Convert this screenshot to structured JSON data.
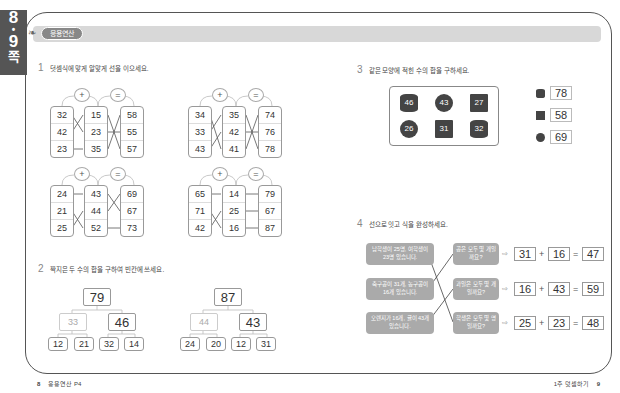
{
  "side_tab": {
    "page_top": "8",
    "dot": "•",
    "page_bottom": "9",
    "suffix": "쪽"
  },
  "header": {
    "badge": "응용연산"
  },
  "q1": {
    "number": "1",
    "title": "덧셈식에 맞게 알맞게 선을 이으세요.",
    "operators": {
      "plus": "+",
      "equals": "="
    },
    "grids": [
      {
        "a": [
          "32",
          "42",
          "23"
        ],
        "b": [
          "15",
          "23",
          "35"
        ],
        "c": [
          "58",
          "55",
          "57"
        ]
      },
      {
        "a": [
          "34",
          "33",
          "43"
        ],
        "b": [
          "35",
          "42",
          "41"
        ],
        "c": [
          "74",
          "76",
          "78"
        ]
      },
      {
        "a": [
          "24",
          "21",
          "25"
        ],
        "b": [
          "43",
          "44",
          "52"
        ],
        "c": [
          "69",
          "67",
          "73"
        ]
      },
      {
        "a": [
          "65",
          "71",
          "42"
        ],
        "b": [
          "14",
          "25",
          "16"
        ],
        "c": [
          "79",
          "67",
          "87"
        ]
      }
    ]
  },
  "q2": {
    "number": "2",
    "title": "짝지은 두 수의 합을 구하여 빈칸에 쓰세요.",
    "trees": [
      {
        "top": "79",
        "left": "33",
        "right": "46",
        "leaves": [
          "12",
          "21",
          "32",
          "14"
        ]
      },
      {
        "top": "87",
        "left": "44",
        "right": "43",
        "leaves": [
          "24",
          "20",
          "12",
          "31"
        ]
      }
    ]
  },
  "q3": {
    "number": "3",
    "title": "같은 모양에 적힌 수의 합을 구하세요.",
    "shapes": [
      {
        "type": "cylinder",
        "value": "46"
      },
      {
        "type": "ball",
        "value": "43"
      },
      {
        "type": "cube",
        "value": "27"
      },
      {
        "type": "ball",
        "value": "26"
      },
      {
        "type": "cube",
        "value": "31"
      },
      {
        "type": "cylinder",
        "value": "32"
      }
    ],
    "answers": [
      {
        "shape": "cylinder",
        "value": "78"
      },
      {
        "shape": "cube",
        "value": "58"
      },
      {
        "shape": "ball",
        "value": "69"
      }
    ]
  },
  "q4": {
    "number": "4",
    "title": "선으로 잇고 식을 완성하세요.",
    "left_bubbles": [
      "남학생이 25명, 여학생이 23명 있습니다.",
      "축구공이 31개, 농구공이 16개 있습니다.",
      "오렌지가 16개, 귤이 43개 있습니다."
    ],
    "right_bubbles": [
      "공은 모두 몇 개일까요?",
      "과일은 모두 몇 개일까요?",
      "학생은 모두 몇 명일까요?"
    ],
    "arrow": "⇨",
    "equations": [
      {
        "a": "31",
        "op": "+",
        "b": "16",
        "eq": "=",
        "c": "47"
      },
      {
        "a": "16",
        "op": "+",
        "b": "43",
        "eq": "=",
        "c": "59"
      },
      {
        "a": "25",
        "op": "+",
        "b": "23",
        "eq": "=",
        "c": "48"
      }
    ]
  },
  "footer": {
    "left_page": "8",
    "left_label": "응용연산 P4",
    "right_label": "1주 덧셈하기",
    "right_page": "9"
  }
}
